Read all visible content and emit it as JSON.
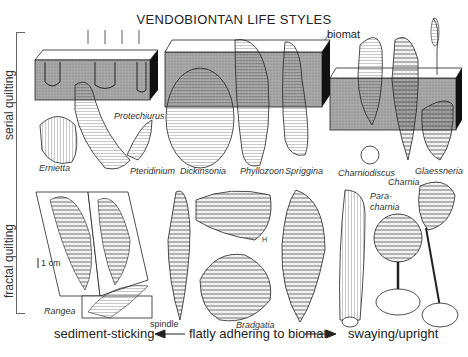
{
  "title": "VENDOBIONTAN LIFE STYLES",
  "side_groups": [
    {
      "label": "serial quilting"
    },
    {
      "label": "fractal quilting"
    }
  ],
  "annotations": {
    "biomat": "biomat",
    "scale": "1 cm",
    "h_mark": "H"
  },
  "organisms": [
    {
      "name": "Protechiurus"
    },
    {
      "name": "Ernietta"
    },
    {
      "name": "Pteridinium"
    },
    {
      "name": "Dickinsonia"
    },
    {
      "name": "Phyllozoon"
    },
    {
      "name": "Spriggina"
    },
    {
      "name": "Charniodiscus"
    },
    {
      "name": "Charnia"
    },
    {
      "name": "Glaessneria"
    },
    {
      "name": "Rangea"
    },
    {
      "name": "spindle"
    },
    {
      "name": "Bradgatia"
    },
    {
      "name": "Para-"
    },
    {
      "name": "charnia"
    }
  ],
  "axis": {
    "left": "sediment-sticking",
    "middle": "flatly adhering to biomat",
    "right": "swaying/upright"
  },
  "colors": {
    "ink": "#222222",
    "sediment": "#9a9a9a",
    "block_side": "#111111"
  }
}
